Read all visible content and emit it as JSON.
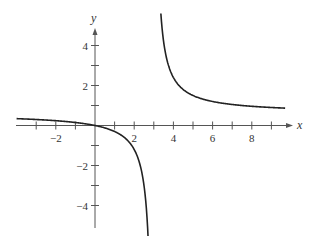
{
  "chart_data": {
    "type": "line",
    "title": "",
    "xlabel": "x",
    "ylabel": "y",
    "xlim": [
      -4,
      10
    ],
    "ylim": [
      -5,
      5
    ],
    "grid": false,
    "legend": null,
    "x_ticks": [
      -3,
      -2,
      -1,
      1,
      2,
      3,
      4,
      5,
      6,
      7,
      8,
      9
    ],
    "x_tick_labels": [
      {
        "value": -2,
        "label": "−2"
      },
      {
        "value": 2,
        "label": "2"
      },
      {
        "value": 4,
        "label": "4"
      },
      {
        "value": 6,
        "label": "6"
      },
      {
        "value": 8,
        "label": "8"
      }
    ],
    "y_ticks": [
      -4,
      -3,
      -2,
      -1,
      1,
      2,
      3,
      4
    ],
    "y_tick_labels": [
      {
        "value": 4,
        "label": "4"
      },
      {
        "value": 2,
        "label": "2"
      },
      {
        "value": -2,
        "label": "−2"
      },
      {
        "value": -4,
        "label": "−4"
      }
    ],
    "vertical_asymptote": 3,
    "horizontal_asymptote": 0.6,
    "series": [
      {
        "name": "left-branch",
        "x": [
          -4,
          -3,
          -2,
          -1,
          0,
          1,
          2,
          2.5,
          2.7
        ],
        "y": [
          0.34,
          0.3,
          0.24,
          0.15,
          0,
          -0.3,
          -1.2,
          -3.0,
          -5.4
        ]
      },
      {
        "name": "right-branch",
        "x": [
          3.37,
          3.5,
          4,
          5,
          6,
          7,
          8,
          9,
          9.7
        ],
        "y": [
          5.5,
          4.2,
          2.4,
          1.5,
          1.2,
          1.05,
          0.96,
          0.9,
          0.87
        ]
      }
    ]
  }
}
